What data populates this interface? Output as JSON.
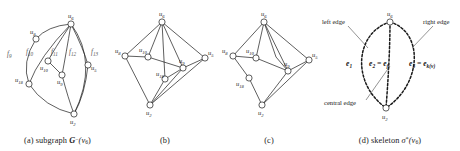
{
  "figure": {
    "panels": [
      {
        "id": "a",
        "caption_prefix": "(a)",
        "caption_word": "subgraph",
        "caption_symbol": "G",
        "caption_sup": "−",
        "caption_arg": "(v",
        "caption_arg_sub": "6",
        "caption_arg_end": ")",
        "vertices": [
          {
            "name": "u6",
            "label": "u",
            "sub": "6"
          },
          {
            "name": "u8",
            "label": "u",
            "sub": "8"
          },
          {
            "name": "u10",
            "label": "u",
            "sub": "10"
          },
          {
            "name": "u9",
            "label": "u",
            "sub": "9"
          },
          {
            "name": "u5",
            "label": "u",
            "sub": "5"
          },
          {
            "name": "u18",
            "label": "u",
            "sub": "18"
          },
          {
            "name": "u2",
            "label": "u",
            "sub": "2"
          }
        ],
        "faces": [
          {
            "name": "f9",
            "label": "f",
            "sub": "9"
          },
          {
            "name": "f10",
            "label": "f",
            "sub": "10"
          },
          {
            "name": "f11",
            "label": "f",
            "sub": "11"
          },
          {
            "name": "f12",
            "label": "f",
            "sub": "12"
          },
          {
            "name": "f13",
            "label": "f",
            "sub": "13"
          }
        ]
      },
      {
        "id": "b",
        "caption_prefix": "(b)",
        "vertices": [
          {
            "name": "u6",
            "label": "u",
            "sub": "6"
          },
          {
            "name": "u8",
            "label": "u",
            "sub": "8"
          },
          {
            "name": "u10",
            "label": "u",
            "sub": "10"
          },
          {
            "name": "u18",
            "label": "u",
            "sub": "18"
          },
          {
            "name": "u9",
            "label": "u",
            "sub": "9"
          },
          {
            "name": "u5",
            "label": "u",
            "sub": "5"
          },
          {
            "name": "u2",
            "label": "u",
            "sub": "2"
          }
        ]
      },
      {
        "id": "c",
        "caption_prefix": "(c)",
        "vertices": [
          {
            "name": "u6",
            "label": "u",
            "sub": "6"
          },
          {
            "name": "u8",
            "label": "u",
            "sub": "8"
          },
          {
            "name": "u10",
            "label": "u",
            "sub": "10"
          },
          {
            "name": "u18",
            "label": "u",
            "sub": "18"
          },
          {
            "name": "u9",
            "label": "u",
            "sub": "9"
          },
          {
            "name": "u5",
            "label": "u",
            "sub": "5"
          },
          {
            "name": "u2",
            "label": "u",
            "sub": "2"
          }
        ]
      },
      {
        "id": "d",
        "caption_prefix": "(d)",
        "caption_word": "skeleton",
        "caption_symbol": "σ",
        "caption_sup": "*",
        "caption_arg": "(v",
        "caption_arg_sub": "6",
        "caption_arg_end": ")",
        "annotations": {
          "left_edge": "left edge",
          "right_edge": "right edge",
          "central_edge": "central edge"
        },
        "edge_labels": [
          {
            "name": "e1",
            "text": "e",
            "sub": "1"
          },
          {
            "name": "e2",
            "text": "e",
            "sub": "2",
            "eq": "=",
            "text2": "e",
            "sub2": "f"
          },
          {
            "name": "e3",
            "text": "e",
            "sub": "3",
            "eq": "=",
            "text2": "e",
            "sub2": "k(v)"
          }
        ],
        "vertices": [
          {
            "name": "u6",
            "label": "u",
            "sub": "6"
          },
          {
            "name": "u2",
            "label": "u",
            "sub": "2"
          }
        ]
      }
    ]
  }
}
